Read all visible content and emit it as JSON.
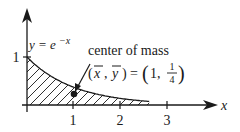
{
  "figure": {
    "curve_label": "y = e",
    "curve_exponent": "−x",
    "annotation": "center of mass",
    "formula_lhs_x": "x",
    "formula_lhs_y": "y",
    "formula_eq": "=",
    "formula_x_val": "1,",
    "formula_frac_num": "1",
    "formula_frac_den": "4",
    "x_axis_label": "x",
    "y_tick_1": "1",
    "x_ticks": [
      "1",
      "2",
      "3"
    ]
  },
  "chart_data": {
    "type": "line",
    "title": "",
    "function": "y = e^{-x}",
    "shaded_region": "area under y = e^{-x} from x = 0 to infinity",
    "center_of_mass": {
      "x": 1,
      "y": 0.25
    },
    "xlabel": "x",
    "ylabel": "",
    "x_ticks": [
      1,
      2,
      3
    ],
    "y_ticks": [
      1
    ],
    "xlim": [
      0,
      4
    ],
    "ylim": [
      0,
      2
    ]
  },
  "colors": {
    "ink": "#1a1a1a",
    "background": "#ffffff"
  }
}
